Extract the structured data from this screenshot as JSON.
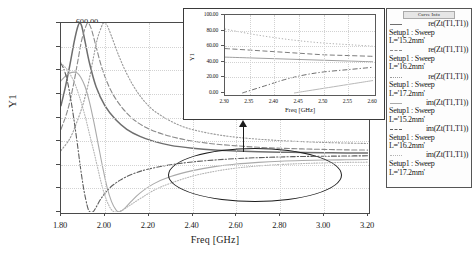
{
  "chart_data": {
    "type": "line",
    "title": "",
    "xlabel": "Freq [GHz]",
    "ylabel": "Y1",
    "xlim": [
      1.8,
      3.2
    ],
    "ylim": [
      -200.0,
      600.0
    ],
    "xticks": [
      "1.80",
      "2.00",
      "2.20",
      "2.40",
      "2.60",
      "2.80",
      "3.00",
      "3.20"
    ],
    "yticks": [
      "600.00",
      "500.00",
      "400.00",
      "300.00",
      "200.00",
      "100.00",
      "0.00",
      "-100.00",
      "-200.00"
    ],
    "grid": true,
    "legend_position": "right-outside",
    "legend_title": "Curve Info",
    "series": [
      {
        "name": "re(Zt(T1,T1))",
        "setup": "Setup1 : Sweep",
        "param": "L='15.2mm'",
        "style": "solid",
        "color": "#6e6e6e",
        "points": [
          [
            1.8,
            250
          ],
          [
            1.82,
            330
          ],
          [
            1.84,
            420
          ],
          [
            1.86,
            520
          ],
          [
            1.875,
            580
          ],
          [
            1.885,
            600
          ],
          [
            1.895,
            585
          ],
          [
            1.91,
            520
          ],
          [
            1.93,
            430
          ],
          [
            1.96,
            330
          ],
          [
            2.0,
            250
          ],
          [
            2.05,
            190
          ],
          [
            2.1,
            150
          ],
          [
            2.16,
            120
          ],
          [
            2.22,
            100
          ],
          [
            2.3,
            82
          ],
          [
            2.4,
            70
          ],
          [
            2.5,
            62
          ],
          [
            2.6,
            58
          ],
          [
            2.7,
            55
          ],
          [
            2.8,
            53
          ],
          [
            2.9,
            52
          ],
          [
            3.0,
            51
          ],
          [
            3.1,
            50
          ],
          [
            3.2,
            50
          ]
        ]
      },
      {
        "name": "re(Zt(T1,T1))",
        "setup": "Setup1 : Sweep",
        "param": "L='16.2mm'",
        "style": "dashed",
        "color": "#8a8a8a",
        "points": [
          [
            1.8,
            150
          ],
          [
            1.83,
            230
          ],
          [
            1.855,
            330
          ],
          [
            1.875,
            430
          ],
          [
            1.895,
            530
          ],
          [
            1.915,
            590
          ],
          [
            1.925,
            600
          ],
          [
            1.94,
            570
          ],
          [
            1.96,
            500
          ],
          [
            1.99,
            400
          ],
          [
            2.03,
            310
          ],
          [
            2.08,
            240
          ],
          [
            2.14,
            185
          ],
          [
            2.21,
            148
          ],
          [
            2.3,
            120
          ],
          [
            2.4,
            100
          ],
          [
            2.5,
            88
          ],
          [
            2.6,
            80
          ],
          [
            2.7,
            74
          ],
          [
            2.8,
            70
          ],
          [
            2.9,
            67
          ],
          [
            3.0,
            65
          ],
          [
            3.1,
            63
          ],
          [
            3.2,
            62
          ]
        ]
      },
      {
        "name": "re(Zt(T1,T1))",
        "setup": "Setup1 : Sweep",
        "param": "L='17.2mm'",
        "style": "dotted",
        "color": "#9a9a9a",
        "points": [
          [
            1.8,
            60
          ],
          [
            1.84,
            110
          ],
          [
            1.87,
            175
          ],
          [
            1.9,
            255
          ],
          [
            1.925,
            345
          ],
          [
            1.945,
            440
          ],
          [
            1.965,
            530
          ],
          [
            1.985,
            585
          ],
          [
            1.995,
            600
          ],
          [
            2.01,
            590
          ],
          [
            2.03,
            545
          ],
          [
            2.06,
            470
          ],
          [
            2.1,
            385
          ],
          [
            2.15,
            305
          ],
          [
            2.21,
            240
          ],
          [
            2.28,
            195
          ],
          [
            2.36,
            160
          ],
          [
            2.45,
            138
          ],
          [
            2.55,
            122
          ],
          [
            2.65,
            112
          ],
          [
            2.75,
            105
          ],
          [
            2.85,
            100
          ],
          [
            2.95,
            96
          ],
          [
            3.05,
            93
          ],
          [
            3.2,
            90
          ]
        ]
      },
      {
        "name": "im(Zt(T1,T1))",
        "setup": "Setup1 : Sweep",
        "param": "L='15.2mm'",
        "style": "solid-light",
        "color": "#aaaaaa",
        "points": [
          [
            1.8,
            355
          ],
          [
            1.82,
            375
          ],
          [
            1.84,
            388
          ],
          [
            1.86,
            392
          ],
          [
            1.875,
            388
          ],
          [
            1.89,
            370
          ],
          [
            1.91,
            330
          ],
          [
            1.93,
            265
          ],
          [
            1.95,
            180
          ],
          [
            1.97,
            85
          ],
          [
            1.99,
            -10
          ],
          [
            2.01,
            -95
          ],
          [
            2.03,
            -155
          ],
          [
            2.05,
            -190
          ],
          [
            2.065,
            -200
          ],
          [
            2.09,
            -185
          ],
          [
            2.12,
            -155
          ],
          [
            2.16,
            -120
          ],
          [
            2.22,
            -82
          ],
          [
            2.3,
            -50
          ],
          [
            2.4,
            -25
          ],
          [
            2.5,
            -8
          ],
          [
            2.6,
            3
          ],
          [
            2.7,
            10
          ],
          [
            2.8,
            15
          ],
          [
            2.9,
            18
          ],
          [
            3.0,
            20
          ],
          [
            3.1,
            21
          ],
          [
            3.2,
            22
          ]
        ]
      },
      {
        "name": "im(Zt(T1,T1))",
        "setup": "Setup1 : Sweep",
        "param": "L='16.2mm'",
        "style": "dash-dot",
        "color": "#5e5e5e",
        "points": [
          [
            1.8,
            430
          ],
          [
            1.815,
            400
          ],
          [
            1.83,
            350
          ],
          [
            1.845,
            275
          ],
          [
            1.86,
            185
          ],
          [
            1.875,
            85
          ],
          [
            1.89,
            -20
          ],
          [
            1.905,
            -110
          ],
          [
            1.92,
            -175
          ],
          [
            1.93,
            -198
          ],
          [
            1.945,
            -200
          ],
          [
            1.96,
            -180
          ],
          [
            1.985,
            -140
          ],
          [
            2.02,
            -100
          ],
          [
            2.07,
            -65
          ],
          [
            2.13,
            -38
          ],
          [
            2.2,
            -18
          ],
          [
            2.3,
            0
          ],
          [
            2.4,
            12
          ],
          [
            2.5,
            20
          ],
          [
            2.6,
            26
          ],
          [
            2.7,
            30
          ],
          [
            2.8,
            33
          ],
          [
            2.9,
            35
          ],
          [
            3.0,
            36
          ],
          [
            3.1,
            37
          ],
          [
            3.2,
            38
          ]
        ]
      },
      {
        "name": "im(Zt(T1,T1))",
        "setup": "Setup1 : Sweep",
        "param": "L='17.2mm'",
        "style": "fine-dotted",
        "color": "#b5b5b5",
        "points": [
          [
            1.8,
            430
          ],
          [
            1.83,
            400
          ],
          [
            1.86,
            350
          ],
          [
            1.885,
            285
          ],
          [
            1.91,
            205
          ],
          [
            1.93,
            130
          ],
          [
            1.95,
            55
          ],
          [
            1.97,
            -25
          ],
          [
            1.99,
            -100
          ],
          [
            2.01,
            -155
          ],
          [
            2.03,
            -190
          ],
          [
            2.05,
            -200
          ],
          [
            2.08,
            -192
          ],
          [
            2.12,
            -168
          ],
          [
            2.17,
            -138
          ],
          [
            2.23,
            -105
          ],
          [
            2.3,
            -78
          ],
          [
            2.4,
            -48
          ],
          [
            2.5,
            -28
          ],
          [
            2.6,
            -14
          ],
          [
            2.7,
            -5
          ],
          [
            2.8,
            1
          ],
          [
            2.9,
            5
          ],
          [
            3.0,
            8
          ],
          [
            3.1,
            10
          ],
          [
            3.2,
            11
          ]
        ]
      }
    ],
    "annotation": {
      "type": "ellipse-callout",
      "description": "ellipse highlighting zoomed region near 0 between 2.30 and 2.70 GHz with arrow to inset"
    },
    "inset": {
      "type": "line",
      "xlabel": "Freq [GHz]",
      "ylabel": "Y1",
      "xlim": [
        2.3,
        2.6
      ],
      "ylim": [
        0.0,
        100.0
      ],
      "xticks": [
        "2.30",
        "2.35",
        "2.40",
        "2.45",
        "2.50",
        "2.55",
        "2.60"
      ],
      "yticks": [
        "100.00",
        "80.00",
        "60.00",
        "40.00",
        "20.00",
        "0.00"
      ],
      "grid": true,
      "series": [
        {
          "name": "re(Zt(T1,T1)) L='17.2mm'",
          "style": "dotted",
          "color": "#a8a8a8",
          "points": [
            [
              2.3,
              82
            ],
            [
              2.35,
              76
            ],
            [
              2.4,
              71
            ],
            [
              2.45,
              67
            ],
            [
              2.5,
              64
            ],
            [
              2.55,
              62
            ],
            [
              2.6,
              60
            ]
          ]
        },
        {
          "name": "re(Zt(T1,T1)) L='16.2mm'",
          "style": "dashed",
          "color": "#6e6e6e",
          "points": [
            [
              2.3,
              57
            ],
            [
              2.35,
              55
            ],
            [
              2.4,
              53
            ],
            [
              2.45,
              51
            ],
            [
              2.5,
              49
            ],
            [
              2.55,
              48
            ],
            [
              2.6,
              47
            ]
          ]
        },
        {
          "name": "re(Zt(T1,T1)) L='15.2mm'",
          "style": "solid",
          "color": "#949494",
          "points": [
            [
              2.3,
              46
            ],
            [
              2.35,
              45
            ],
            [
              2.4,
              44
            ],
            [
              2.45,
              43
            ],
            [
              2.5,
              42
            ],
            [
              2.55,
              41
            ],
            [
              2.6,
              40
            ]
          ]
        },
        {
          "name": "im(Zt(T1,T1)) L='16.2mm'",
          "style": "dash-dot",
          "color": "#5e5e5e",
          "points": [
            [
              2.335,
              0
            ],
            [
              2.38,
              9
            ],
            [
              2.42,
              17
            ],
            [
              2.46,
              23
            ],
            [
              2.5,
              27
            ],
            [
              2.55,
              30
            ],
            [
              2.6,
              33
            ]
          ]
        },
        {
          "name": "im(Zt(T1,T1)) L='15.2mm'",
          "style": "solid-light",
          "color": "#b0b0b0",
          "points": [
            [
              2.44,
              0
            ],
            [
              2.47,
              3
            ],
            [
              2.5,
              6
            ],
            [
              2.54,
              10
            ],
            [
              2.57,
              13
            ],
            [
              2.6,
              16
            ]
          ]
        }
      ]
    }
  },
  "axes": {
    "main": {
      "y_title": "Y1",
      "x_title": "Freq [GHz]",
      "yticks": [
        "600.00",
        "500.00",
        "400.00",
        "300.00",
        "200.00",
        "100.00",
        "0.00",
        "-100.00",
        "-200.00"
      ],
      "xticks": [
        "1.80",
        "2.00",
        "2.20",
        "2.40",
        "2.60",
        "2.80",
        "3.00",
        "3.20"
      ]
    },
    "inset": {
      "y_title": "Y1",
      "x_title": "Freq [GHz]",
      "yticks": [
        "100.00",
        "80.00",
        "60.00",
        "40.00",
        "20.00",
        "0.00"
      ],
      "xticks": [
        "2.30",
        "2.35",
        "2.40",
        "2.45",
        "2.50",
        "2.55",
        "2.60"
      ]
    }
  },
  "legend": {
    "title": "Curve Info",
    "entries": [
      {
        "name": "re(Zt(T1,T1))",
        "setup": "Setup1 : Sweep",
        "param": "L='15.2mm'"
      },
      {
        "name": "re(Zt(T1,T1))",
        "setup": "Setup1 : Sweep",
        "param": "L='16.2mm'"
      },
      {
        "name": "re(Zt(T1,T1))",
        "setup": "Setup1 : Sweep",
        "param": "L='17.2mm'"
      },
      {
        "name": "im(Zt(T1,T1))",
        "setup": "Setup1 : Sweep",
        "param": "L='15.2mm'"
      },
      {
        "name": "im(Zt(T1,T1))",
        "setup": "Setup1 : Sweep",
        "param": "L='16.2mm'"
      },
      {
        "name": "im(Zt(T1,T1))",
        "setup": "Setup1 : Sweep",
        "param": "L='17.2mm'"
      }
    ]
  },
  "colors": {
    "axis": "#4a4a4a",
    "grid": "#d2d2d2",
    "annotation": "#1c1c1c",
    "background": "#ffffff"
  }
}
